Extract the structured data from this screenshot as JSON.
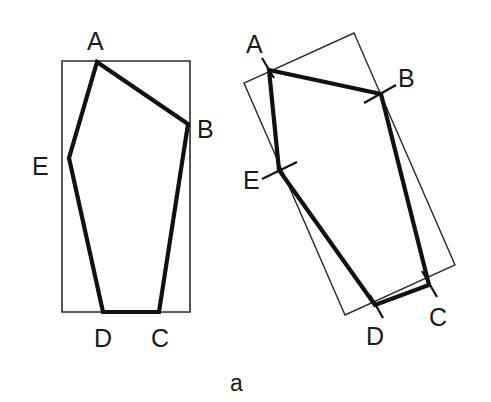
{
  "figure": {
    "caption": "a",
    "background_color": "#ffffff",
    "ink_color": "#111111",
    "box_color": "#2b2b2b",
    "panels": [
      {
        "id": "left-panel",
        "name": "axis-aligned-bounding-box-panel",
        "bounding_box": {
          "type": "axis-aligned-rectangle",
          "points": "62,61 190,61 190,312 62,312"
        },
        "polygon": {
          "name": "pentagon-ABCDE",
          "points": "97,62 188,124 159,312 103,312 69,158",
          "closed": true
        },
        "vertices": [
          {
            "label": "A",
            "x": 97,
            "y": 62,
            "label_x": 87,
            "label_y": 50
          },
          {
            "label": "B",
            "x": 188,
            "y": 124,
            "label_x": 197,
            "label_y": 138
          },
          {
            "label": "C",
            "x": 159,
            "y": 312,
            "label_x": 151,
            "label_y": 347
          },
          {
            "label": "D",
            "x": 103,
            "y": 312,
            "label_x": 94,
            "label_y": 347
          },
          {
            "label": "E",
            "x": 69,
            "y": 158,
            "label_x": 32,
            "label_y": 175
          }
        ],
        "tick_marks": []
      },
      {
        "id": "right-panel",
        "name": "rotated-minimum-bounding-box-panel",
        "bounding_box": {
          "type": "rotated-rectangle",
          "points": "354,33 455,265 345,315 244,83"
        },
        "polygon": {
          "name": "pentagon-ABCDE",
          "points": "269,70 381,94 429,285 375,305 279,170",
          "closed": true
        },
        "vertices": [
          {
            "label": "A",
            "x": 269,
            "y": 70,
            "label_x": 246,
            "label_y": 53
          },
          {
            "label": "B",
            "x": 381,
            "y": 94,
            "label_x": 398,
            "label_y": 87
          },
          {
            "label": "C",
            "x": 429,
            "y": 285,
            "label_x": 429,
            "label_y": 326
          },
          {
            "label": "D",
            "x": 375,
            "y": 305,
            "label_x": 366,
            "label_y": 345
          },
          {
            "label": "E",
            "x": 279,
            "y": 170,
            "label_x": 243,
            "label_y": 189
          }
        ],
        "tick_marks": [
          {
            "name": "tick-at-A",
            "x1": 262,
            "y1": 58,
            "x2": 274,
            "y2": 78
          },
          {
            "name": "tick-at-B",
            "x1": 364,
            "y1": 103,
            "x2": 396,
            "y2": 85
          },
          {
            "name": "tick-at-E",
            "x1": 262,
            "y1": 179,
            "x2": 297,
            "y2": 162
          },
          {
            "name": "tick-at-C",
            "x1": 422,
            "y1": 271,
            "x2": 437,
            "y2": 297
          },
          {
            "name": "tick-at-D",
            "x1": 370,
            "y1": 295,
            "x2": 383,
            "y2": 318
          }
        ]
      }
    ],
    "caption_position": {
      "x": 230,
      "y": 391
    }
  }
}
